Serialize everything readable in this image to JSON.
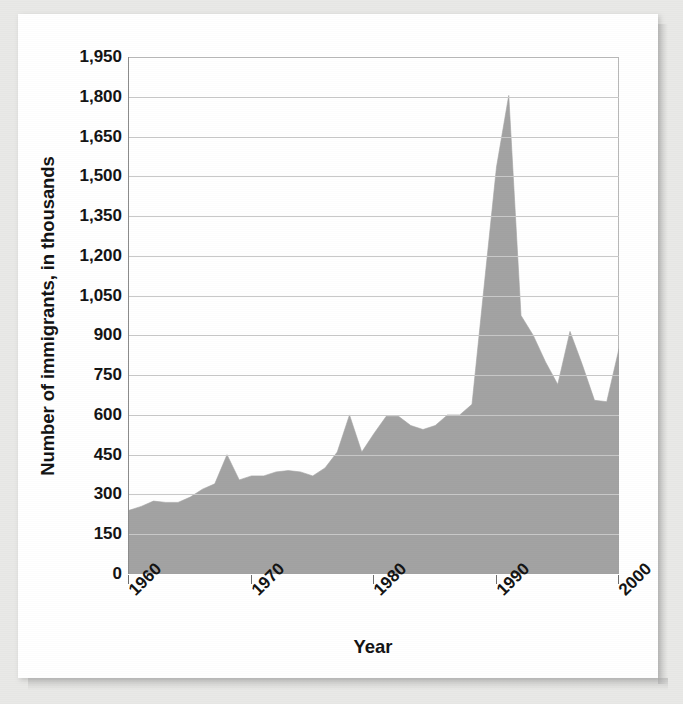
{
  "chart_data": {
    "type": "area",
    "title": "",
    "xlabel": "Year",
    "ylabel": "Number of immigrants, in thousands",
    "xlim": [
      1960,
      2000
    ],
    "ylim": [
      0,
      1950
    ],
    "grid": true,
    "legend": false,
    "fill_color": "#a3a3a3",
    "gridline_color": "#c9c9c9",
    "axis_color": "#8c8c8c",
    "text_color": "#141414",
    "y_ticks": [
      0,
      150,
      300,
      450,
      600,
      750,
      900,
      1050,
      1200,
      1350,
      1500,
      1650,
      1800,
      1950
    ],
    "y_tick_labels": [
      "0",
      "150",
      "300",
      "450",
      "600",
      "750",
      "900",
      "1,050",
      "1,200",
      "1,350",
      "1,500",
      "1,650",
      "1,800",
      "1,950"
    ],
    "x_ticks": [
      1960,
      1970,
      1980,
      1990,
      2000
    ],
    "x_tick_labels": [
      "1960",
      "1970",
      "1980",
      "1990",
      "2000"
    ],
    "x": [
      1960,
      1961,
      1962,
      1963,
      1964,
      1965,
      1966,
      1967,
      1968,
      1969,
      1970,
      1971,
      1972,
      1973,
      1974,
      1975,
      1976,
      1977,
      1978,
      1979,
      1980,
      1981,
      1982,
      1983,
      1984,
      1985,
      1986,
      1987,
      1988,
      1989,
      1990,
      1991,
      1992,
      1993,
      1994,
      1995,
      1996,
      1997,
      1998,
      1999,
      2000
    ],
    "values": [
      240,
      255,
      275,
      270,
      270,
      290,
      320,
      340,
      450,
      355,
      370,
      370,
      385,
      390,
      385,
      370,
      400,
      460,
      600,
      460,
      530,
      595,
      595,
      560,
      545,
      560,
      600,
      600,
      640,
      1090,
      1535,
      1805,
      975,
      900,
      800,
      715,
      915,
      790,
      655,
      650,
      850
    ]
  },
  "figure": {
    "axis_title_x": "Year",
    "axis_title_y": "Number of immigrants, in thousands"
  }
}
